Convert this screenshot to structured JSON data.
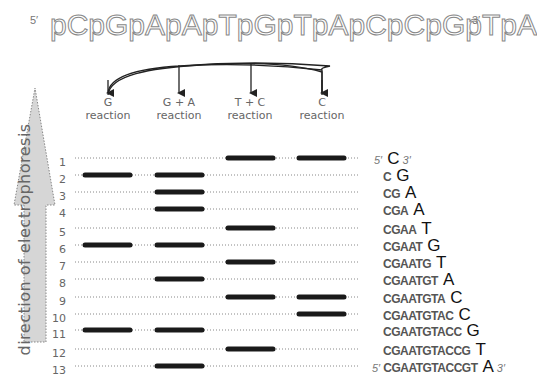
{
  "header": {
    "five_prime": "5′",
    "sequence": "pCpGpApApTpGpTpApCpCpGpTpA",
    "three_prime": "3′"
  },
  "reactions": [
    {
      "line1": "G",
      "line2": "reaction"
    },
    {
      "line1": "G + A",
      "line2": "reaction"
    },
    {
      "line1": "T + C",
      "line2": "reaction"
    },
    {
      "line1": "C",
      "line2": "reaction"
    }
  ],
  "direction_label": "direction of electrophoresis",
  "lanes": [
    "1",
    "2",
    "3",
    "4",
    "5",
    "6",
    "7",
    "8",
    "9",
    "10",
    "11",
    "12",
    "13"
  ],
  "bands": {
    "1": [
      2,
      3
    ],
    "2": [
      0,
      1
    ],
    "3": [
      1
    ],
    "4": [
      1
    ],
    "5": [
      2
    ],
    "6": [
      0,
      1
    ],
    "7": [
      2
    ],
    "8": [
      1
    ],
    "9": [
      2,
      3
    ],
    "10": [
      3
    ],
    "11": [
      0,
      1
    ],
    "12": [
      2
    ],
    "13": [
      1
    ]
  },
  "fragments": [
    {
      "prefix": "",
      "last": "C",
      "p5": "5′",
      "p3": "3′"
    },
    {
      "prefix": "C",
      "last": "G"
    },
    {
      "prefix": "CG",
      "last": "A"
    },
    {
      "prefix": "CGA",
      "last": "A"
    },
    {
      "prefix": "CGAA",
      "last": "T"
    },
    {
      "prefix": "CGAAT",
      "last": "G"
    },
    {
      "prefix": "CGAATG",
      "last": "T"
    },
    {
      "prefix": "CGAATGT",
      "last": "A"
    },
    {
      "prefix": "CGAATGTA",
      "last": "C"
    },
    {
      "prefix": "CGAATGTAC",
      "last": "C"
    },
    {
      "prefix": "CGAATGTACC",
      "last": "G"
    },
    {
      "prefix": "CGAATGTACCG",
      "last": "T"
    },
    {
      "prefix": "CGAATGTACCGT",
      "last": "A",
      "p5": "5′",
      "p3": "3′"
    }
  ],
  "colors": {
    "band": "#1a1a1a",
    "dotted_line": "#888888",
    "arrow_fill": "#d6d6d6"
  }
}
